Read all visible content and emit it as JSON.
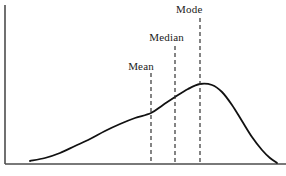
{
  "chart_data": {
    "type": "line",
    "title": "",
    "subtitle": "",
    "xlabel": "",
    "ylabel": "",
    "grid": false,
    "legend": "none",
    "distribution": "negatively skewed (left-skewed) unimodal density curve",
    "xlim": [
      0,
      286
    ],
    "ylim": [
      0,
      176
    ],
    "axes": {
      "x_axis_y": 164,
      "x_axis_x_start": 5,
      "x_axis_x_end": 286,
      "y_axis_x": 5,
      "y_axis_y_top": 5,
      "y_axis_y_bottom": 164,
      "color": "#4d4d4d"
    },
    "curve": {
      "color": "#111111",
      "width": 1.8,
      "points": [
        [
          30,
          161
        ],
        [
          45,
          158
        ],
        [
          60,
          153
        ],
        [
          75,
          146
        ],
        [
          90,
          139
        ],
        [
          105,
          131
        ],
        [
          120,
          124
        ],
        [
          135,
          118
        ],
        [
          151,
          113
        ],
        [
          163,
          105
        ],
        [
          175,
          97
        ],
        [
          188,
          89
        ],
        [
          200,
          84
        ],
        [
          212,
          85
        ],
        [
          222,
          92
        ],
        [
          232,
          105
        ],
        [
          242,
          121
        ],
        [
          252,
          137
        ],
        [
          262,
          150
        ],
        [
          270,
          158
        ],
        [
          277,
          163
        ]
      ]
    },
    "markers": [
      {
        "id": "mean",
        "label": "Mean",
        "x": 151,
        "line_top": 73,
        "line_bottom": 164,
        "curve_y": 113,
        "style": "dashed",
        "color": "#333333"
      },
      {
        "id": "median",
        "label": "Median",
        "x": 175,
        "line_top": 46,
        "line_bottom": 164,
        "curve_y": 97,
        "style": "dashed",
        "color": "#333333"
      },
      {
        "id": "mode",
        "label": "Mode",
        "x": 200,
        "line_top": 18,
        "line_bottom": 164,
        "curve_y": 84,
        "style": "dashed",
        "color": "#333333"
      }
    ],
    "annotations": [
      "Mean",
      "Median",
      "Mode"
    ],
    "relationship": "Mean < Median < Mode"
  },
  "labels": {
    "mean": "Mean",
    "median": "Median",
    "mode": "Mode"
  },
  "colors": {
    "background": "#ffffff",
    "curve": "#111111",
    "axis": "#4d4d4d",
    "marker": "#333333",
    "text": "#1a1a1a"
  }
}
